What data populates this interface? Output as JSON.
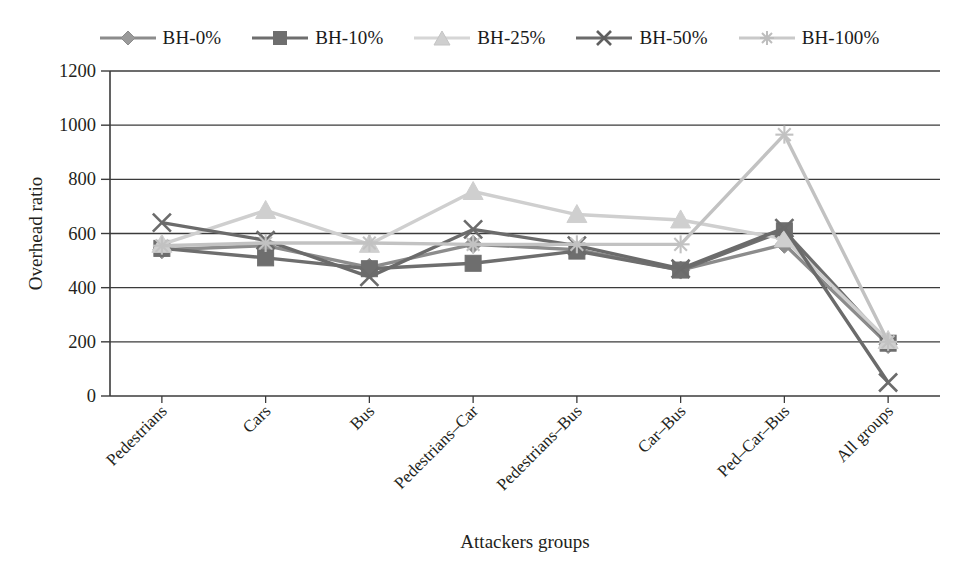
{
  "chart_data": {
    "type": "line",
    "title": "",
    "xlabel": "Attackers groups",
    "ylabel": "Overhead ratio",
    "categories": [
      "Pedestrians",
      "Cars",
      "Bus",
      "Pedestrians–Car",
      "Pedestrians–Bus",
      "Car–Bus",
      "Ped–Car–Bus",
      "All groups"
    ],
    "ylim": [
      0,
      1200
    ],
    "yticks": [
      0,
      200,
      400,
      600,
      800,
      1000,
      1200
    ],
    "ytick_labels": [
      "0",
      "200",
      "400",
      "600",
      "800",
      "1000",
      "1200"
    ],
    "grid": "horizontal",
    "legend_position": "top",
    "series": [
      {
        "name": "BH-0%",
        "marker": "diamond",
        "color": "#8c8c8c",
        "values": [
          540,
          555,
          475,
          560,
          540,
          465,
          560,
          190
        ]
      },
      {
        "name": "BH-10%",
        "marker": "square",
        "color": "#6e6e6e",
        "values": [
          545,
          510,
          470,
          490,
          535,
          465,
          610,
          195
        ]
      },
      {
        "name": "BH-25%",
        "marker": "triangle",
        "color": "#cfcfcf",
        "values": [
          560,
          685,
          560,
          755,
          670,
          650,
          580,
          205
        ]
      },
      {
        "name": "BH-50%",
        "marker": "x",
        "color": "#6b6b6b",
        "values": [
          640,
          575,
          440,
          615,
          555,
          470,
          620,
          50
        ]
      },
      {
        "name": "BH-100%",
        "marker": "star",
        "color": "#c2c2c2",
        "values": [
          555,
          565,
          565,
          560,
          560,
          560,
          965,
          200
        ]
      }
    ]
  },
  "legend": {
    "items": [
      {
        "label": "BH-0%"
      },
      {
        "label": "BH-10%"
      },
      {
        "label": "BH-25%"
      },
      {
        "label": "BH-50%"
      },
      {
        "label": "BH-100%"
      }
    ]
  },
  "axes": {
    "y_title": "Overhead ratio",
    "x_title": "Attackers groups"
  }
}
